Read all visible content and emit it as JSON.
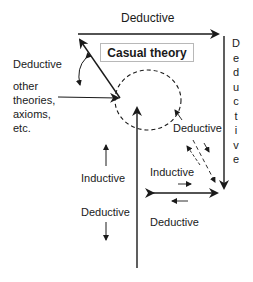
{
  "diagram": {
    "title_box": "Casual theory",
    "labels": {
      "top_deductive": "Deductive",
      "left_deductive": "Deductive",
      "other_sources": [
        "other",
        "theories,",
        "axioms,",
        "etc."
      ],
      "right_vertical_deductive": [
        "D",
        "e",
        "d",
        "u",
        "c",
        "t",
        "i",
        "v",
        "e"
      ],
      "inner_deductive": "Deductive",
      "left_inductive": "Inductive",
      "left_lower_deductive": "Deductive",
      "right_inductive": "Inductive",
      "bottom_right_deductive": "Deductive"
    },
    "colors": {
      "line": "#1a1a1a",
      "box_border": "#b8b8b8",
      "background": "#ffffff"
    }
  }
}
